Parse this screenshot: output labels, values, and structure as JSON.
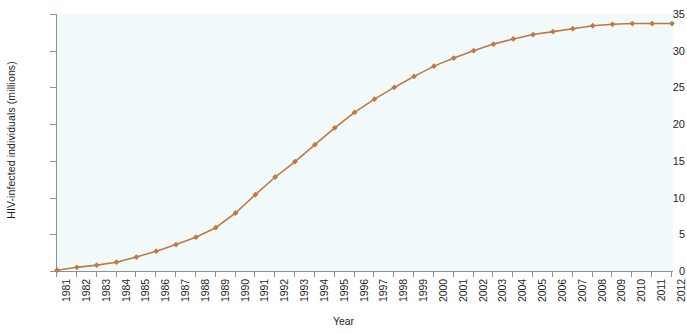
{
  "chart_data": {
    "type": "line",
    "title": "",
    "xlabel": "Year",
    "ylabel": "HIV-infected individuals (millions)",
    "xlim": [
      1981,
      2012
    ],
    "ylim": [
      0,
      35
    ],
    "ytick_labels": [
      "0",
      "5",
      "10",
      "15",
      "20",
      "25",
      "30",
      "35"
    ],
    "ytick_values": [
      0,
      5,
      10,
      15,
      20,
      25,
      30,
      35
    ],
    "grid": false,
    "legend_position": "none",
    "series_color": "#bd7b43",
    "marker": "diamond",
    "categories": [
      "1981",
      "1982",
      "1983",
      "1984",
      "1985",
      "1986",
      "1987",
      "1988",
      "1989",
      "1990",
      "1991",
      "1992",
      "1993",
      "1994",
      "1995",
      "1996",
      "1997",
      "1998",
      "1999",
      "2000",
      "2001",
      "2002",
      "2003",
      "2004",
      "2005",
      "2006",
      "2007",
      "2008",
      "2009",
      "2010",
      "2011",
      "2012"
    ],
    "x": [
      1981,
      1982,
      1983,
      1984,
      1985,
      1986,
      1987,
      1988,
      1989,
      1990,
      1991,
      1992,
      1993,
      1994,
      1995,
      1996,
      1997,
      1998,
      1999,
      2000,
      2001,
      2002,
      2003,
      2004,
      2005,
      2006,
      2007,
      2008,
      2009,
      2010,
      2011,
      2012
    ],
    "values": [
      0.1,
      0.5,
      0.8,
      1.2,
      1.9,
      2.7,
      3.6,
      4.6,
      5.9,
      7.9,
      10.4,
      12.8,
      14.9,
      17.2,
      19.5,
      21.6,
      23.4,
      25.0,
      26.5,
      27.9,
      29.0,
      30.0,
      30.9,
      31.6,
      32.2,
      32.6,
      33.0,
      33.4,
      33.6,
      33.7,
      33.7,
      33.7
    ],
    "series": [
      {
        "name": "HIV-infected individuals (millions)",
        "values": [
          0.1,
          0.5,
          0.8,
          1.2,
          1.9,
          2.7,
          3.6,
          4.6,
          5.9,
          7.9,
          10.4,
          12.8,
          14.9,
          17.2,
          19.5,
          21.6,
          23.4,
          25.0,
          26.5,
          27.9,
          29.0,
          30.0,
          30.9,
          31.6,
          32.2,
          32.6,
          33.0,
          33.4,
          33.6,
          33.7,
          33.7,
          33.7
        ]
      }
    ]
  },
  "axes": {
    "y_title": "HIV-infected individuals (millions)",
    "x_title": "Year"
  },
  "style": {
    "plot_background": "#f2f9fa",
    "axis_color": "#8d9294",
    "line_color": "#bd7b43",
    "marker_color": "#bd7b43",
    "text_color": "#231f20"
  }
}
